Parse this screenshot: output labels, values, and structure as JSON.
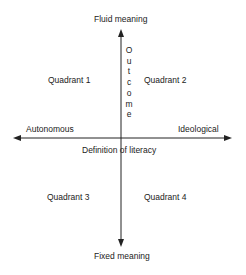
{
  "diagram": {
    "vertical_axis": {
      "top_label": "Fluid meaning",
      "bottom_label": "Fixed meaning",
      "axis_title": "Outcome",
      "axis_title_letters": [
        "O",
        "u",
        "t",
        "c",
        "o",
        "m",
        "e"
      ]
    },
    "horizontal_axis": {
      "left_label": "Autonomous",
      "right_label": "Ideological",
      "axis_title": "Definition of literacy"
    },
    "quadrants": [
      {
        "label": "Quadrant 1"
      },
      {
        "label": "Quadrant 2"
      },
      {
        "label": "Quadrant 3"
      },
      {
        "label": "Quadrant 4"
      }
    ],
    "colors": {
      "line": "#222222",
      "background": "#ffffff"
    }
  }
}
